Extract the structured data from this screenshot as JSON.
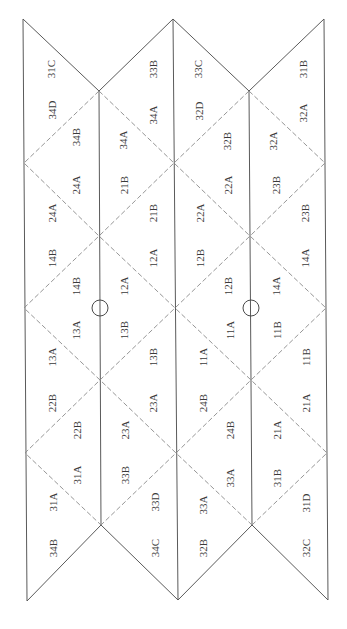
{
  "diagram": {
    "type": "folded-grid-label-map",
    "orientation": "labels rotated -90deg",
    "colors": {
      "solid_line": "#5a5a5a",
      "dashed_line": "#8a8a8a",
      "text": "#3a3a3a"
    },
    "labels": [
      {
        "text": "31C",
        "x": 51,
        "y": 69
      },
      {
        "text": "33B",
        "x": 153,
        "y": 69
      },
      {
        "text": "33C",
        "x": 198,
        "y": 69
      },
      {
        "text": "31B",
        "x": 303,
        "y": 69
      },
      {
        "text": "34D",
        "x": 52,
        "y": 110
      },
      {
        "text": "34A",
        "x": 153,
        "y": 115
      },
      {
        "text": "32D",
        "x": 199,
        "y": 111
      },
      {
        "text": "32A",
        "x": 303,
        "y": 113
      },
      {
        "text": "34B",
        "x": 76,
        "y": 137
      },
      {
        "text": "34A",
        "x": 123,
        "y": 140
      },
      {
        "text": "32B",
        "x": 227,
        "y": 141
      },
      {
        "text": "32A",
        "x": 273,
        "y": 141
      },
      {
        "text": "24A",
        "x": 76,
        "y": 185
      },
      {
        "text": "21B",
        "x": 124,
        "y": 185
      },
      {
        "text": "22A",
        "x": 228,
        "y": 185
      },
      {
        "text": "23B",
        "x": 276,
        "y": 185
      },
      {
        "text": "24A",
        "x": 52,
        "y": 213
      },
      {
        "text": "21B",
        "x": 153,
        "y": 213
      },
      {
        "text": "22A",
        "x": 200,
        "y": 213
      },
      {
        "text": "23B",
        "x": 305,
        "y": 213
      },
      {
        "text": "14B",
        "x": 52,
        "y": 258
      },
      {
        "text": "12A",
        "x": 153,
        "y": 258
      },
      {
        "text": "12B",
        "x": 200,
        "y": 258
      },
      {
        "text": "14A",
        "x": 305,
        "y": 258
      },
      {
        "text": "14B",
        "x": 76,
        "y": 286
      },
      {
        "text": "12A",
        "x": 124,
        "y": 286
      },
      {
        "text": "12B",
        "x": 228,
        "y": 286
      },
      {
        "text": "14A",
        "x": 276,
        "y": 286
      },
      {
        "text": "13A",
        "x": 76,
        "y": 330
      },
      {
        "text": "13B",
        "x": 124,
        "y": 330
      },
      {
        "text": "11A",
        "x": 230,
        "y": 330
      },
      {
        "text": "11B",
        "x": 277,
        "y": 330
      },
      {
        "text": "13A",
        "x": 52,
        "y": 357
      },
      {
        "text": "13B",
        "x": 153,
        "y": 357
      },
      {
        "text": "11A",
        "x": 203,
        "y": 357
      },
      {
        "text": "11B",
        "x": 306,
        "y": 357
      },
      {
        "text": "22B",
        "x": 52,
        "y": 403
      },
      {
        "text": "23A",
        "x": 153,
        "y": 403
      },
      {
        "text": "24B",
        "x": 203,
        "y": 403
      },
      {
        "text": "21A",
        "x": 306,
        "y": 403
      },
      {
        "text": "22B",
        "x": 77,
        "y": 430
      },
      {
        "text": "23A",
        "x": 125,
        "y": 430
      },
      {
        "text": "24B",
        "x": 230,
        "y": 430
      },
      {
        "text": "21A",
        "x": 277,
        "y": 430
      },
      {
        "text": "31A",
        "x": 77,
        "y": 475
      },
      {
        "text": "33B",
        "x": 125,
        "y": 475
      },
      {
        "text": "33A",
        "x": 230,
        "y": 478
      },
      {
        "text": "31B",
        "x": 277,
        "y": 478
      },
      {
        "text": "31A",
        "x": 53,
        "y": 502
      },
      {
        "text": "33D",
        "x": 155,
        "y": 502
      },
      {
        "text": "33A",
        "x": 203,
        "y": 505
      },
      {
        "text": "31D",
        "x": 306,
        "y": 503
      },
      {
        "text": "34B",
        "x": 53,
        "y": 548
      },
      {
        "text": "34C",
        "x": 155,
        "y": 548
      },
      {
        "text": "32B",
        "x": 203,
        "y": 548
      },
      {
        "text": "32C",
        "x": 306,
        "y": 548
      }
    ],
    "markers": [
      {
        "name": "circle-marker-left",
        "cx": 100,
        "cy": 308,
        "r": 8
      },
      {
        "name": "circle-marker-right",
        "cx": 251,
        "cy": 308,
        "r": 8
      }
    ]
  }
}
